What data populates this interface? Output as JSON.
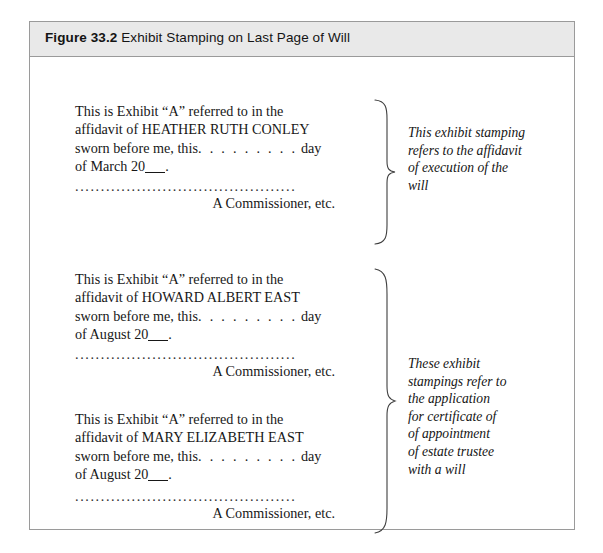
{
  "figure": {
    "number": "Figure 33.2",
    "caption": "Exhibit Stamping on Last Page of Will",
    "border_color": "#9a9a9a",
    "caption_bar_color": "#e9e9e9"
  },
  "stamps": [
    {
      "id": "exhibit-stamp-conley",
      "line1": "This is Exhibit “A” referred to in the",
      "line2_prefix": "affidavit of ",
      "deponent": "HEATHER RUTH CONLEY",
      "line3_prefix": "sworn before me, this",
      "line3_dots": ". . . . . . . . .",
      "line3_suffix": "day",
      "line4_prefix": "of ",
      "month": "March",
      "year_prefix": " 20",
      "year_suffix": ".",
      "leader": "...........................................",
      "commissioner": "A Commissioner, etc."
    },
    {
      "id": "exhibit-stamp-howard-east",
      "line1": "This is Exhibit “A” referred to in the",
      "line2_prefix": "affidavit of ",
      "deponent": "HOWARD ALBERT EAST",
      "line3_prefix": "sworn before me, this",
      "line3_dots": ". . . . . . . . .",
      "line3_suffix": "day",
      "line4_prefix": "of ",
      "month": "August",
      "year_prefix": " 20",
      "year_suffix": ".",
      "leader": "...........................................",
      "commissioner": "A Commissioner, etc."
    },
    {
      "id": "exhibit-stamp-mary-east",
      "line1": "This is Exhibit “A” referred to in the",
      "line2_prefix": "affidavit of ",
      "deponent": "MARY ELIZABETH EAST",
      "line3_prefix": "sworn before me, this",
      "line3_dots": ". . . . . . . . .",
      "line3_suffix": "day",
      "line4_prefix": "of ",
      "month": "August",
      "year_prefix": " 20",
      "year_suffix": ".",
      "leader": "...........................................",
      "commissioner": "A Commissioner, etc."
    }
  ],
  "annotations": [
    {
      "id": "annotation-affidavit-of-execution",
      "lines": [
        "This exhibit stamping",
        "refers to the affidavit",
        "of execution of the",
        "will"
      ]
    },
    {
      "id": "annotation-certificate-of-appointment",
      "lines": [
        "These exhibit",
        "stampings refer to",
        "the application",
        "for certificate of",
        "of appointment",
        "of estate trustee",
        "with a will"
      ]
    }
  ]
}
